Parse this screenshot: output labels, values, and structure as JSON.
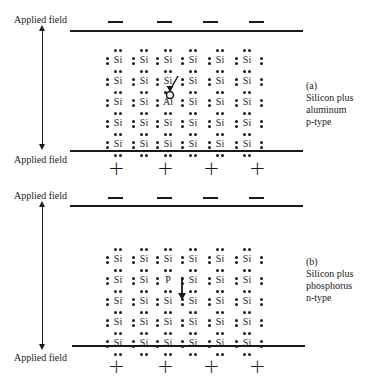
{
  "figure": {
    "panels": [
      {
        "id": "a",
        "applied_field_top": "Applied field",
        "applied_field_bottom": "Applied field",
        "top_signs": [
          "—",
          "—",
          "—",
          "—"
        ],
        "bottom_signs": [
          "+",
          "+",
          "+",
          "+"
        ],
        "caption": {
          "letter": "(a)",
          "line1": "Silicon plus",
          "line2": "aluminum",
          "line3": "p-type"
        },
        "lattice": {
          "rows": [
            [
              "Si",
              "Si",
              "Si",
              "Si",
              "Si",
              "Si"
            ],
            [
              "Si",
              "Si",
              "Si",
              "Si",
              "Si",
              "Si"
            ],
            [
              "Si",
              "Si",
              "Al",
              "Si",
              "Si",
              "Si"
            ],
            [
              "Si",
              "Si",
              "Si",
              "Si",
              "Si",
              "Si"
            ],
            [
              "Si",
              "Si",
              "Si",
              "Si",
              "Si",
              "Si"
            ]
          ],
          "dopant": "Al",
          "carrier": "hole"
        }
      },
      {
        "id": "b",
        "applied_field_top": "Applied field",
        "applied_field_bottom": "Applied field",
        "top_signs": [
          "—",
          "—",
          "—",
          "—"
        ],
        "bottom_signs": [
          "+",
          "+",
          "+",
          "+"
        ],
        "caption": {
          "letter": "(b)",
          "line1": "Silicon plus",
          "line2": "phosphorus",
          "line3": "n-type"
        },
        "lattice": {
          "rows": [
            [
              "Si",
              "Si",
              "Si",
              "Si",
              "Si",
              "Si"
            ],
            [
              "Si",
              "Si",
              "P",
              "Si",
              "Si",
              "Si"
            ],
            [
              "Si",
              "Si",
              "Si",
              "Si",
              "Si",
              "Si"
            ],
            [
              "Si",
              "Si",
              "Si",
              "Si",
              "Si",
              "Si"
            ],
            [
              "Si",
              "Si",
              "Si",
              "Si",
              "Si",
              "Si"
            ]
          ],
          "dopant": "P",
          "carrier": "electron"
        }
      }
    ]
  }
}
